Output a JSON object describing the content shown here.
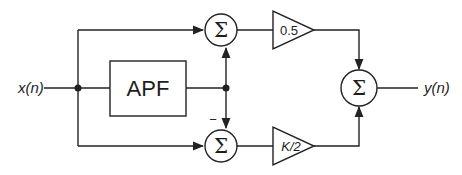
{
  "diagram": {
    "input_label": "x(n)",
    "output_label": "y(n)",
    "apf_block": {
      "label": "APF"
    },
    "sum_top": {
      "symbol": "Σ"
    },
    "sum_bottom": {
      "symbol": "Σ",
      "minus_sign": "−"
    },
    "sum_output": {
      "symbol": "Σ"
    },
    "gain_top": {
      "label": "0.5"
    },
    "gain_bottom": {
      "label": "K/2"
    },
    "colors": {
      "line": "#222222",
      "background": "#ffffff"
    }
  }
}
